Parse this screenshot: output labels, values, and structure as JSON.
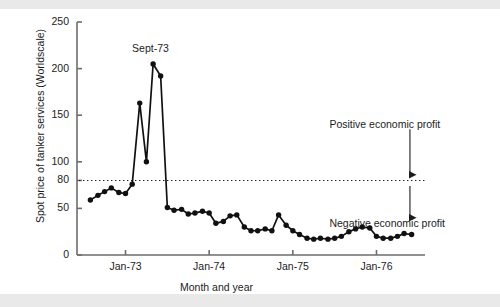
{
  "figure": {
    "background": "#ffffff",
    "line_color": "#111111",
    "marker_color": "#111111",
    "axis_color": "#6d6d6d",
    "text_color": "#1c1c1c",
    "scan_band_color": "#e9e9ea"
  },
  "chart_data": {
    "type": "line",
    "title": "",
    "subtitle": "",
    "xlabel": "Month and year",
    "ylabel": "Spot price of tanker services (Worldscale)",
    "ylim": [
      0,
      250
    ],
    "xlim": [
      1972.42,
      1976.58
    ],
    "yticks": [
      0,
      50,
      80,
      100,
      150,
      200,
      250
    ],
    "ytick_labels": [
      "0",
      "50",
      "80",
      "100",
      "150",
      "200",
      "250"
    ],
    "xticks": [
      1973.0,
      1974.0,
      1975.0,
      1976.0
    ],
    "xtick_labels": [
      "Jan-73",
      "Jan-74",
      "Jan-75",
      "Jan-76"
    ],
    "grid": false,
    "legend": null,
    "markers": "filled-circle",
    "reference_lines": [
      {
        "name": "breakeven-line",
        "orientation": "horizontal",
        "y": 80,
        "style": "dotted",
        "label": "80"
      }
    ],
    "annotations": [
      {
        "name": "peak-label",
        "text": "Sept-73",
        "x": 1973.7,
        "y": 205
      },
      {
        "name": "positive-profit-label",
        "text": "Positive economic profit",
        "x": 1976.25,
        "y": 140
      },
      {
        "name": "negative-profit-label",
        "text": "Negative economic profit",
        "x": 1976.25,
        "y": 33
      },
      {
        "name": "profit-arrow",
        "text": "",
        "x": 1976.4,
        "y": 80
      }
    ],
    "series": [
      {
        "name": "Spot price of tanker services (Worldscale)",
        "x": [
          1972.58,
          1972.67,
          1972.75,
          1972.83,
          1972.92,
          1973.0,
          1973.08,
          1973.17,
          1973.25,
          1973.33,
          1973.42,
          1973.5,
          1973.58,
          1973.67,
          1973.75,
          1973.83,
          1973.92,
          1974.0,
          1974.08,
          1974.17,
          1974.25,
          1974.33,
          1974.42,
          1974.5,
          1974.58,
          1974.67,
          1974.75,
          1974.83,
          1974.92,
          1975.0,
          1975.08,
          1975.17,
          1975.25,
          1975.33,
          1975.42,
          1975.5,
          1975.58,
          1975.67,
          1975.75,
          1975.83,
          1975.92,
          1976.0,
          1976.08,
          1976.17,
          1976.25,
          1976.33,
          1976.42
        ],
        "values": [
          59,
          64,
          68,
          72,
          67,
          66,
          76,
          163,
          100,
          205,
          192,
          51,
          48,
          49,
          44,
          45,
          47,
          45,
          34,
          36,
          42,
          43,
          30,
          26,
          26,
          28,
          26,
          43,
          32,
          26,
          22,
          18,
          17,
          18,
          17,
          18,
          20,
          25,
          28,
          30,
          29,
          20,
          18,
          18,
          20,
          23,
          22
        ]
      }
    ]
  }
}
